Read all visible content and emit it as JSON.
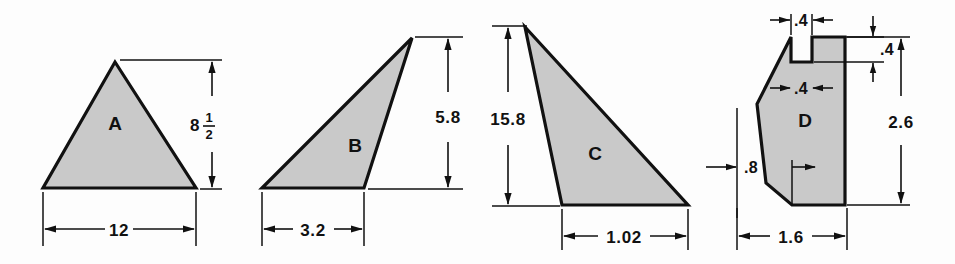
{
  "figure": {
    "background_color": "#fdfdfd",
    "shape_fill_color": "#c9c9c9",
    "line_color": "#111111"
  },
  "shapes": [
    {
      "id": "A",
      "label": "A",
      "type": "isosceles-triangle",
      "dimensions": [
        {
          "name": "height",
          "value": "8",
          "fraction_numerator": "1",
          "fraction_denominator": "2",
          "display": "8 1/2",
          "orientation": "vertical"
        },
        {
          "name": "base",
          "value": "12",
          "display": "12",
          "orientation": "horizontal"
        }
      ]
    },
    {
      "id": "B",
      "label": "B",
      "type": "obtuse-triangle",
      "dimensions": [
        {
          "name": "height",
          "value": "5.8",
          "display": "5.8",
          "orientation": "vertical"
        },
        {
          "name": "base",
          "value": "3.2",
          "display": "3.2",
          "orientation": "horizontal"
        }
      ]
    },
    {
      "id": "C",
      "label": "C",
      "type": "obtuse-triangle",
      "dimensions": [
        {
          "name": "height",
          "value": "15.8",
          "display": "15.8",
          "orientation": "vertical"
        },
        {
          "name": "base",
          "value": "1.02",
          "display": "1.02",
          "orientation": "horizontal"
        }
      ]
    },
    {
      "id": "D",
      "label": "D",
      "type": "notched-polygon",
      "dimensions": [
        {
          "name": "notch-width-top",
          "value": ".4",
          "display": ".4",
          "orientation": "horizontal"
        },
        {
          "name": "notch-depth",
          "value": ".4",
          "display": ".4",
          "orientation": "vertical"
        },
        {
          "name": "notch-width-inner",
          "value": ".4",
          "display": ".4",
          "orientation": "horizontal"
        },
        {
          "name": "total-height",
          "value": "2.6",
          "display": "2.6",
          "orientation": "vertical"
        },
        {
          "name": "left-offset",
          "value": ".8",
          "display": ".8",
          "orientation": "horizontal"
        },
        {
          "name": "total-width",
          "value": "1.6",
          "display": "1.6",
          "orientation": "horizontal"
        }
      ]
    }
  ],
  "labels": {
    "a": "A",
    "b": "B",
    "c": "C",
    "d": "D",
    "a_height_whole": "8",
    "a_height_num": "1",
    "a_height_den": "2",
    "a_base": "12",
    "b_height": "5.8",
    "b_base": "3.2",
    "c_height": "15.8",
    "c_base": "1.02",
    "d_notch_top": ".4",
    "d_notch_depth": ".4",
    "d_notch_inner": ".4",
    "d_total_height": "2.6",
    "d_left_offset": ".8",
    "d_total_width": "1.6"
  }
}
